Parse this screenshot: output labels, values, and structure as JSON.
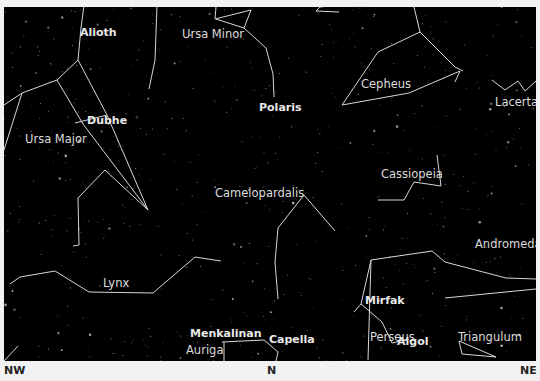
{
  "map": {
    "background": "#000000",
    "line_color": "#d8d8d8",
    "directions": {
      "nw": "NW",
      "n": "N",
      "ne": "NE"
    },
    "constellations": {
      "ursa_major": "Ursa Major",
      "ursa_minor": "Ursa Minor",
      "cepheus": "Cepheus",
      "lacerta": "Lacerta",
      "cassiopeia": "Cassiopeia",
      "camelopardalis": "Camelopardalis",
      "andromeda": "Andromeda",
      "lynx": "Lynx",
      "auriga": "Auriga",
      "perseus": "Perseus",
      "triangulum": "Triangulum"
    },
    "stars": {
      "alioth": "Alioth",
      "dubhe": "Dubhe",
      "polaris": "Polaris",
      "menkalinan": "Menkalinan",
      "capella": "Capella",
      "mirfak": "Mirfak",
      "algol": "Algol"
    }
  }
}
